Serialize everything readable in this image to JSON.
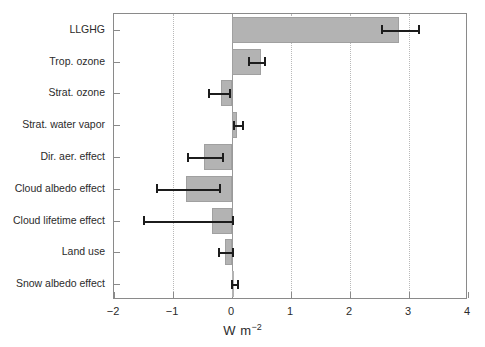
{
  "chart_data": {
    "type": "bar",
    "orientation": "horizontal",
    "title": "",
    "subtitle": "",
    "xlabel": "W m−2",
    "ylabel": "",
    "xlim": [
      -2,
      4
    ],
    "ylim": [
      0,
      9
    ],
    "grid": "vertical-dotted",
    "legend": "none",
    "xticks": [
      "-2",
      "-1",
      "0",
      "1",
      "2",
      "3",
      "4"
    ],
    "xtick_values": [
      -2,
      -1,
      0,
      1,
      2,
      3,
      4
    ],
    "categories": [
      "LLGHG",
      "Trop. ozone",
      "Strat. ozone",
      "Strat. water vapor",
      "Dir. aer. effect",
      "Cloud albedo effect",
      "Cloud lifetime effect",
      "Land use",
      "Snow albedo effect"
    ],
    "values": [
      2.83,
      0.49,
      -0.19,
      0.08,
      -0.47,
      -0.78,
      -0.34,
      -0.12,
      0.04
    ],
    "error_low": [
      2.53,
      0.27,
      -0.41,
      0.02,
      -0.76,
      -1.29,
      -1.51,
      -0.24,
      -0.01
    ],
    "error_high": [
      3.15,
      0.54,
      -0.05,
      0.17,
      -0.17,
      -0.22,
      0.0,
      0.0,
      0.09
    ],
    "bar_color": "#b3b3b3",
    "bar_edge_color": "#a0a0a0",
    "error_color": "#1c1c1c",
    "axis_color": "#8a8a8a",
    "grid_color": "#b9b9b9",
    "background": "#ffffff"
  },
  "axis": {
    "unit_prefix": "W m",
    "unit_exponent": "−2"
  }
}
